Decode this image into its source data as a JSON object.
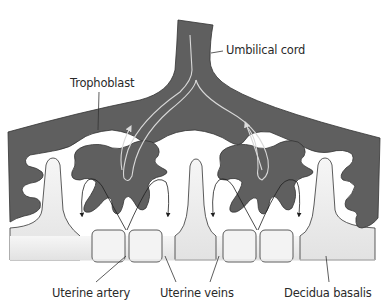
{
  "diagram": {
    "type": "placenta-cross-section",
    "colors": {
      "trophoblast_fill": "#5f5f5f",
      "outline": "#333333",
      "decidua_fill": "#e8e8e8",
      "background": "#ffffff",
      "cord_vessel_stroke": "#d8d8d8",
      "arrow_stroke": "#1e1e1e"
    },
    "labels": {
      "umbilical_cord": "Umbilical cord",
      "trophoblast": "Trophoblast",
      "uterine_artery": "Uterine artery",
      "uterine_veins": "Uterine veins",
      "decidua_basalis": "Decidua basalis"
    }
  }
}
